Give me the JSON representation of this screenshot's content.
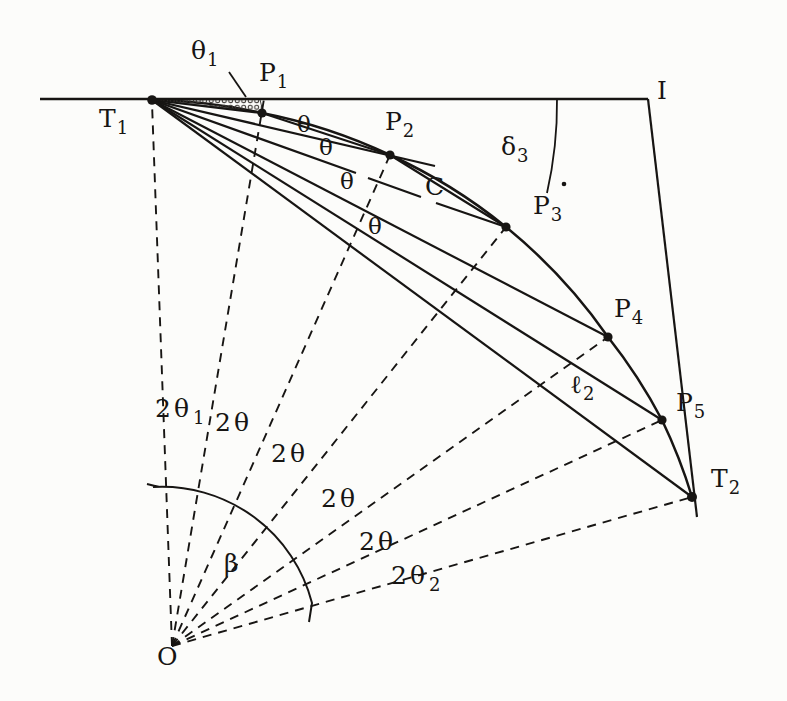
{
  "figure": {
    "type": "geometry-diagram",
    "colors": {
      "background": "#fcfcfa",
      "ink": "#171513"
    },
    "labels": {
      "t1": {
        "main": "T",
        "sub": "1"
      },
      "theta1": {
        "main": "θ",
        "sub": "1"
      },
      "p1": {
        "main": "P",
        "sub": "1"
      },
      "p2": {
        "main": "P",
        "sub": "2"
      },
      "p3": {
        "main": "P",
        "sub": "3"
      },
      "p4": {
        "main": "P",
        "sub": "4"
      },
      "p5": {
        "main": "P",
        "sub": "5"
      },
      "t2": {
        "main": "T",
        "sub": "2"
      },
      "i": {
        "main": "I"
      },
      "o": {
        "main": "O"
      },
      "delta3": {
        "main": "δ",
        "sub": "3"
      },
      "c": {
        "main": "C"
      },
      "ell2": {
        "main": "ℓ",
        "sub": "2"
      },
      "theta_a": {
        "main": "θ"
      },
      "theta_b": {
        "main": "θ"
      },
      "theta_c": {
        "main": "θ"
      },
      "theta_d": {
        "main": "θ"
      },
      "two_theta1": {
        "main": "2θ",
        "sub": "1"
      },
      "two_theta_a": {
        "main": "2θ"
      },
      "two_theta_b": {
        "main": "2θ"
      },
      "two_theta_c": {
        "main": "2θ"
      },
      "two_theta_d": {
        "main": "2θ"
      },
      "two_theta2": {
        "main": "2θ",
        "sub": "2"
      },
      "beta": {
        "main": "β"
      }
    }
  }
}
